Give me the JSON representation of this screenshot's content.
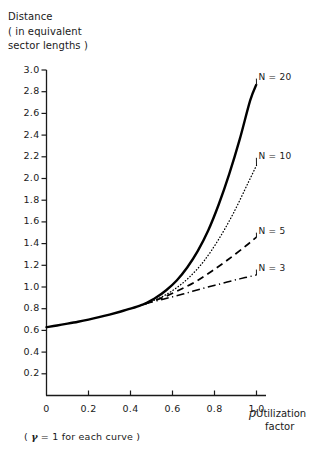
{
  "chart_data": {
    "type": "line",
    "title": "",
    "ylabel_lines": [
      "Distance",
      "( in equivalent",
      "sector lengths )"
    ],
    "xlabel_symbol": "ρ",
    "xlabel_lines": [
      "Utilization",
      "factor"
    ],
    "footnote": "( γ = 1 for each curve )",
    "footnote_symbol": "γ",
    "footnote_rest": " = 1 for each curve )",
    "footnote_open": "( ",
    "xlim": [
      0,
      1.0
    ],
    "ylim": [
      0,
      3.0
    ],
    "grid": false,
    "legend_position": "inline-right",
    "xticks": [
      0,
      0.2,
      0.4,
      0.6,
      0.8,
      1.0
    ],
    "xtick_labels": [
      "0",
      "0.2",
      "0.4",
      "0.6",
      "0.8",
      "1.0"
    ],
    "yticks": [
      0.2,
      0.4,
      0.6,
      0.8,
      1.0,
      1.2,
      1.4,
      1.6,
      1.8,
      2.0,
      2.2,
      2.4,
      2.6,
      2.8,
      3.0
    ],
    "ytick_labels": [
      "0.2",
      "0.4",
      "0.6",
      "0.8",
      "1.0",
      "1.2",
      "1.4",
      "1.6",
      "1.8",
      "2.0",
      "2.2",
      "2.4",
      "2.6",
      "2.8",
      "3.0"
    ],
    "origin_label": "0",
    "shared_segment": {
      "note": "all four curves coincide from rho=0 to rho=0.47",
      "x": [
        0.0,
        0.05,
        0.1,
        0.15,
        0.2,
        0.25,
        0.3,
        0.35,
        0.4,
        0.45,
        0.47
      ],
      "y": [
        0.63,
        0.645,
        0.662,
        0.68,
        0.7,
        0.722,
        0.746,
        0.772,
        0.8,
        0.832,
        0.846
      ]
    },
    "series": [
      {
        "name": "N = 20",
        "label": "N = 20",
        "style": "solid",
        "linewidth": 2.4,
        "x": [
          0.47,
          0.52,
          0.57,
          0.62,
          0.67,
          0.72,
          0.77,
          0.82,
          0.87,
          0.92,
          0.97,
          1.0
        ],
        "y": [
          0.846,
          0.9,
          0.97,
          1.06,
          1.18,
          1.33,
          1.52,
          1.76,
          2.04,
          2.36,
          2.72,
          2.87
        ],
        "label_x": 0.99,
        "label_y": 2.93
      },
      {
        "name": "N = 10",
        "label": "N = 10",
        "style": "dotted",
        "linewidth": 1.3,
        "x": [
          0.47,
          0.54,
          0.61,
          0.68,
          0.75,
          0.82,
          0.89,
          0.96,
          1.0
        ],
        "y": [
          0.846,
          0.9,
          0.98,
          1.09,
          1.24,
          1.44,
          1.68,
          1.96,
          2.12
        ],
        "label_x": 0.99,
        "label_y": 2.2
      },
      {
        "name": "N = 5",
        "label": "N = 5",
        "style": "dashed",
        "linewidth": 1.7,
        "x": [
          0.47,
          0.55,
          0.63,
          0.71,
          0.79,
          0.87,
          0.95,
          1.0
        ],
        "y": [
          0.846,
          0.9,
          0.97,
          1.05,
          1.15,
          1.26,
          1.38,
          1.46
        ],
        "label_x": 0.99,
        "label_y": 1.51
      },
      {
        "name": "N = 3",
        "label": "N = 3",
        "style": "dashdot",
        "linewidth": 1.5,
        "x": [
          0.47,
          0.56,
          0.65,
          0.74,
          0.83,
          0.92,
          1.0
        ],
        "y": [
          0.846,
          0.89,
          0.935,
          0.985,
          1.03,
          1.075,
          1.11
        ],
        "label_x": 0.99,
        "label_y": 1.17
      }
    ],
    "colors": {
      "axis": "#1a1a1a",
      "curve": "#000000",
      "background": "#ffffff",
      "text": "#1a1a1a"
    }
  }
}
